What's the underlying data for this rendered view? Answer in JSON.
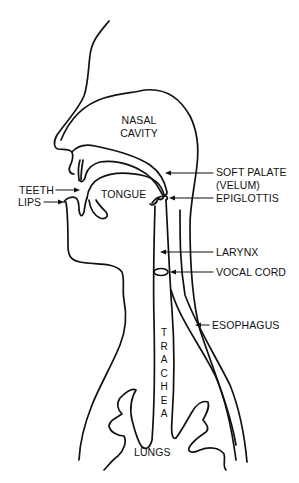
{
  "diagram": {
    "stroke_color": "#111111",
    "background": "#ffffff",
    "labels": {
      "nasal_cavity_line1": "NASAL",
      "nasal_cavity_line2": "CAVITY",
      "soft_palate_line1": "SOFT PALATE",
      "soft_palate_line2": "(VELUM)",
      "teeth": "TEETH",
      "lips": "LIPS",
      "tongue": "TONGUE",
      "epiglottis": "EPIGLOTTIS",
      "larynx": "LARYNX",
      "vocal_cord": "VOCAL CORD",
      "esophagus": "ESOPHAGUS",
      "trachea_letters": [
        "T",
        "R",
        "A",
        "C",
        "H",
        "E",
        "A"
      ],
      "lungs": "LUNGS"
    }
  }
}
